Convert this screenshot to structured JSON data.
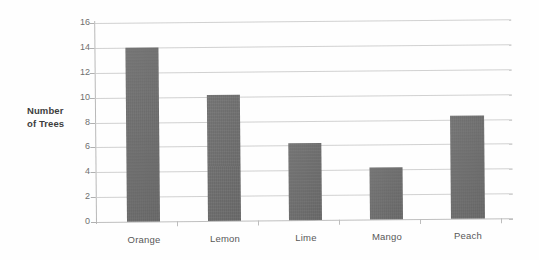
{
  "chart_data": {
    "type": "bar",
    "title": "",
    "subtitle": "",
    "xlabel": "",
    "ylabel": "Number of Trees",
    "ylabel_lines": [
      "Number",
      "of Trees"
    ],
    "categories": [
      "Orange",
      "Lemon",
      "Lime",
      "Mango",
      "Peach"
    ],
    "values": [
      14,
      10.1,
      6.2,
      4.2,
      8.3
    ],
    "ylim": [
      0,
      16
    ],
    "ytick_step": 2,
    "ytick_labels": [
      "16",
      "14",
      "12",
      "10",
      "8",
      "6",
      "4",
      "2",
      "0"
    ],
    "ytick_values": [
      16,
      14,
      12,
      10,
      8,
      6,
      4,
      2,
      0
    ],
    "grid": true,
    "grid_axis": "y",
    "legend": false,
    "legend_position": "none",
    "annotations": [],
    "colors": {
      "bar_fill": "#6d6d6d",
      "gridline": "#c9c9c9",
      "axis_line": "#b9b9b9",
      "tick_label": "#6f6f6f",
      "category_label": "#585858",
      "axis_title": "#3d3d3d",
      "background": "#ffffff"
    }
  }
}
